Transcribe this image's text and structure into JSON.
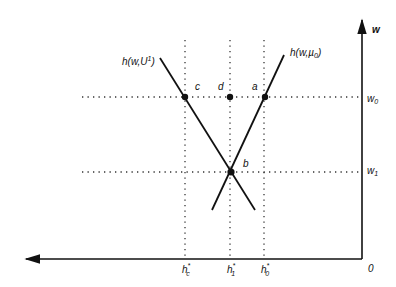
{
  "diagram": {
    "axes": {
      "y_label": "w",
      "origin_label": "0"
    },
    "curves": [
      {
        "id": "curve-u1",
        "label": "h(w,U¹)",
        "label_main": "h(w,U",
        "label_sup": "1",
        "label_tail": ")"
      },
      {
        "id": "curve-u0",
        "label": "h(w,µ₀)",
        "label_main": "h(w,µ",
        "label_sub": "0",
        "label_tail": ")"
      }
    ],
    "y_ticks": [
      {
        "label": "w",
        "sub": "0"
      },
      {
        "label": "w",
        "sub": "1"
      }
    ],
    "x_ticks": [
      {
        "label": "h",
        "sup": "*",
        "sub": "c"
      },
      {
        "label": "h",
        "sup": "*",
        "sub": "1"
      },
      {
        "label": "h",
        "sup": "*",
        "sub": "0"
      }
    ],
    "points": [
      {
        "label": "c"
      },
      {
        "label": "d"
      },
      {
        "label": "a"
      },
      {
        "label": "b"
      }
    ],
    "colors": {
      "ink": "#111111",
      "background": "#ffffff"
    }
  }
}
